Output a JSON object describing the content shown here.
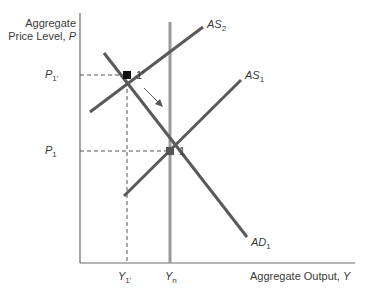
{
  "diagram": {
    "type": "AD-AS model",
    "y_axis_label_line1": "Aggregate",
    "y_axis_label_line2": "Price Level, ",
    "y_axis_var": "P",
    "x_axis_label": "Aggregate Output, ",
    "x_axis_var": "Y",
    "curves": {
      "as2": {
        "name": "AS",
        "sub": "2"
      },
      "as1": {
        "name": "AS",
        "sub": "1"
      },
      "ad1": {
        "name": "AD",
        "sub": "1"
      },
      "yn": {
        "name": "Y",
        "sub": "n"
      }
    },
    "points": {
      "p1prime": {
        "label": "1'",
        "price": "P",
        "price_sub": "1'",
        "output": "Y",
        "output_sub": "1'"
      },
      "p1": {
        "label": "1",
        "price": "P",
        "price_sub": "1"
      }
    },
    "colors": {
      "curve": "#5a5a5a",
      "vertical": "#9a9a9a",
      "axis": "#6a6a6a",
      "point": "#111111"
    }
  }
}
